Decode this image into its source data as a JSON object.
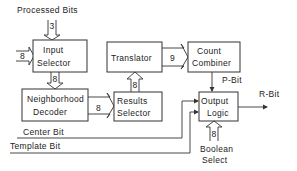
{
  "diagram": {
    "blocks": {
      "input_selector": [
        "Input",
        "Selector"
      ],
      "neighborhood_decoder": [
        "Neighborhood",
        "Decoder"
      ],
      "translator": [
        "Translator"
      ],
      "count_combiner": [
        "Count",
        "Combiner"
      ],
      "results_selector": [
        "Results",
        "Selector"
      ],
      "output_logic": [
        "Output",
        "Logic"
      ]
    },
    "labels": {
      "processed_bits": "Processed Bits",
      "p_bit": "P-Bit",
      "r_bit": "R-Bit",
      "center_bit": "Center Bit",
      "template_bit": "Template Bit",
      "boolean_select": [
        "Boolean",
        "Select"
      ]
    },
    "bus_widths": {
      "processed_bits_in": "3",
      "input_selector_side": "8",
      "input_to_decoder": "8",
      "decoder_to_results": "8",
      "results_to_translator": "8",
      "translator_to_combiner": "9",
      "boolean_select_in": "8"
    }
  }
}
